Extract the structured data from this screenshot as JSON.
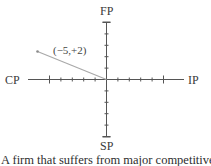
{
  "diagram": {
    "type": "space-matrix-axes",
    "axes": {
      "top": "FP",
      "bottom": "SP",
      "left": "CP",
      "right": "IP",
      "range": [
        -6,
        6
      ],
      "tick_step": 1
    },
    "vector": {
      "label": "(−5,+2)",
      "x": -5,
      "y": 2,
      "color": "#a9a9a9"
    },
    "axis_color": "#555555"
  },
  "caption": "A firm that suffers from major competitive"
}
